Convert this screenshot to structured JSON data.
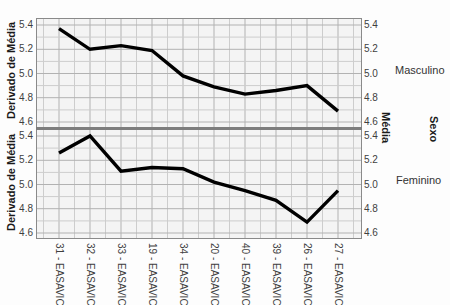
{
  "title": {
    "text": "Fig 10 Escala Média EASAVIC por Sexo"
  },
  "chart_data": {
    "type": "line",
    "categories": [
      "31 - EASAVIC",
      "32 - EASAVIC",
      "33 - EASAVIC",
      "19 - EASAVIC",
      "34 - EASAVIC",
      "20 - EASAVIC",
      "40 - EASAVIC",
      "39 - EASAVIC",
      "26 - EASAVIC",
      "27 - EASAVIC"
    ],
    "series": [
      {
        "name": "Masculino",
        "values": [
          5.37,
          5.2,
          5.23,
          5.19,
          4.98,
          4.89,
          4.83,
          4.86,
          4.9,
          4.69
        ]
      },
      {
        "name": "Feminino",
        "values": [
          5.26,
          5.4,
          5.11,
          5.14,
          5.13,
          5.02,
          4.95,
          4.87,
          4.69,
          4.95
        ]
      }
    ],
    "ylabel": "Derivado de Média",
    "right_label": "Média",
    "panel_label": "Sexo",
    "xlabel": "",
    "ylim": [
      4.55,
      5.45
    ],
    "ytick_labels": [
      "5.4",
      "5.2",
      "5.0",
      "4.8",
      "4.6"
    ],
    "ytick_values": [
      5.4,
      5.2,
      5.0,
      4.8,
      4.6
    ],
    "grid": "minor-and-major, both axes",
    "legend_position": "panel names at right of each panel"
  },
  "colors": {
    "line": "#000000",
    "grid_minor": "#cdcdcd",
    "grid_major": "#b2b2b2",
    "panel_bg": "#f4f4f4",
    "panel_border": "#8a8a8a",
    "text": "#3f3f3f"
  }
}
